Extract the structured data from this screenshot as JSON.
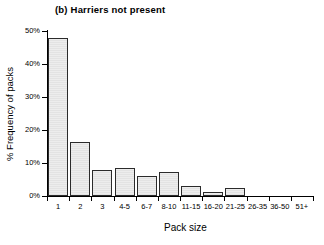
{
  "figure": {
    "panel_label": "(b)",
    "title": "(b)  Harriers not present",
    "background": "#ffffff",
    "ink_color": "#000000",
    "bar_fill": "#e8e8e8",
    "bar_edge": "#2b2b2b"
  },
  "chart_data": {
    "type": "bar",
    "title": "(b)  Harriers not present",
    "xlabel": "Pack size",
    "ylabel": "% Frequency of packs",
    "categories": [
      "1",
      "2",
      "3",
      "4-5",
      "6-7",
      "8-10",
      "11-15",
      "16-20",
      "21-25",
      "26-35",
      "36-50",
      "51+"
    ],
    "values": [
      48.0,
      16.3,
      7.9,
      8.4,
      6.0,
      7.4,
      2.9,
      1.3,
      2.3,
      0.0,
      0.0,
      0.0
    ],
    "ylim": [
      0,
      50
    ],
    "ytick_values": [
      0,
      10,
      20,
      30,
      40,
      50
    ],
    "ytick_labels": [
      "0%",
      "10%",
      "20%",
      "30%",
      "40%",
      "50%"
    ],
    "grid": false,
    "legend": null
  }
}
